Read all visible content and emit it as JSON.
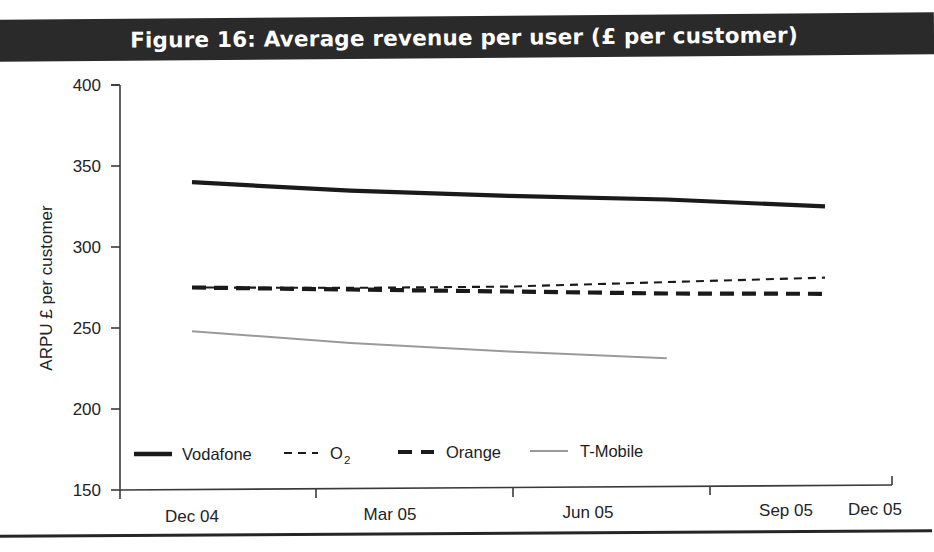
{
  "title": {
    "text": "Figure 16: Average revenue per user (£ per customer)",
    "banner_color": "#2b2a2a",
    "text_color": "#ffffff"
  },
  "chart_data": {
    "type": "line",
    "title": "Figure 16: Average revenue per user (£ per customer)",
    "xlabel": "",
    "ylabel": "ARPU £ per customer",
    "categories": [
      "Dec 04",
      "Mar 05",
      "Jun 05",
      "Sep 05",
      "Dec 05"
    ],
    "x": [
      0,
      1,
      2,
      3,
      4
    ],
    "ylim": [
      150,
      400
    ],
    "yticks": [
      150,
      200,
      250,
      300,
      350,
      400
    ],
    "ytick_labels": [
      "150",
      "200",
      "250",
      "300",
      "350",
      "400"
    ],
    "grid": false,
    "legend_position": "inside-bottom-left",
    "series": [
      {
        "name": "Vodafone",
        "style": "solid-thick",
        "color": "#1a1a1a",
        "x": [
          0,
          1,
          2,
          3,
          4
        ],
        "values": [
          340,
          334,
          330,
          327,
          322
        ]
      },
      {
        "name": "O2",
        "label_base": "O",
        "label_sub": "2",
        "style": "fine-dashed",
        "color": "#1a1a1a",
        "x": [
          0,
          1,
          2,
          3,
          4
        ],
        "values": [
          275,
          274,
          274,
          276,
          278
        ]
      },
      {
        "name": "Orange",
        "style": "bold-dashed",
        "color": "#1a1a1a",
        "x": [
          0,
          1,
          2,
          3,
          4
        ],
        "values": [
          275,
          273,
          271,
          269,
          268
        ]
      },
      {
        "name": "T-Mobile",
        "style": "solid-thin-gray",
        "color": "#9a9a9a",
        "x": [
          0,
          1,
          2,
          3
        ],
        "values": [
          248,
          240,
          234,
          229
        ]
      }
    ]
  },
  "legend": {
    "items": [
      {
        "label": "Vodafone",
        "swatch": "solid-thick-swatch"
      },
      {
        "label": "O",
        "sub": "2",
        "swatch": "fine-dashed-swatch"
      },
      {
        "label": "Orange",
        "swatch": "bold-dashed-swatch"
      },
      {
        "label": "T-Mobile",
        "swatch": "thin-gray-swatch"
      }
    ]
  }
}
